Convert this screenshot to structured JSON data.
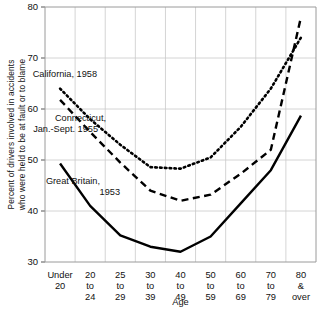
{
  "chart_data": {
    "type": "line",
    "title": "",
    "xlabel": "Age",
    "ylabel": "Percent of drivers involved in accidents who were held to be at fault or to blame",
    "ylabel_line1": "Percent of drivers involved in accidents",
    "ylabel_line2": "who were held to be at fault or to blame",
    "categories": [
      "Under 20",
      "20 to 24",
      "25 to 29",
      "30 to 39",
      "40 to 49",
      "50 to 59",
      "60 to 69",
      "70 to 79",
      "80 & over"
    ],
    "category_lines": [
      [
        "Under",
        "20"
      ],
      [
        "20",
        "to",
        "24"
      ],
      [
        "25",
        "to",
        "29"
      ],
      [
        "30",
        "to",
        "39"
      ],
      [
        "40",
        "to",
        "49"
      ],
      [
        "50",
        "to",
        "59"
      ],
      [
        "60",
        "to",
        "69"
      ],
      [
        "70",
        "to",
        "79"
      ],
      [
        "80",
        "&",
        "over"
      ]
    ],
    "ylim": [
      30,
      80
    ],
    "yticks": [
      30,
      40,
      50,
      60,
      70,
      80
    ],
    "ytick_labels": [
      "30",
      "40",
      "50",
      "60",
      "70",
      "80"
    ],
    "grid": true,
    "legend": "inline-annotations",
    "series": [
      {
        "name": "California, 1958",
        "style": "dotted",
        "color": "#000000",
        "label_lines": [
          "California, 1958"
        ],
        "values": [
          64.0,
          58.0,
          53.0,
          48.6,
          48.3,
          50.5,
          56.5,
          64.0,
          74.0
        ]
      },
      {
        "name": "Connecticut, Jan.-Sept. 1955",
        "style": "dashed",
        "color": "#000000",
        "label_lines": [
          "Connecticut,",
          "Jan.-Sept. 1955"
        ],
        "values": [
          61.8,
          55.5,
          49.5,
          44.0,
          42.0,
          43.2,
          47.3,
          52.0,
          78.0
        ]
      },
      {
        "name": "Great Britain, 1953",
        "style": "solid",
        "color": "#000000",
        "label_lines": [
          "Great Britain,",
          "1953"
        ],
        "values": [
          49.3,
          41.0,
          35.2,
          33.0,
          32.0,
          35.0,
          41.5,
          48.0,
          58.7
        ]
      }
    ]
  },
  "annotations": [
    {
      "text": "California, 1958",
      "x": 97,
      "y": 77
    },
    {
      "text": "Connecticut,",
      "x": 106,
      "y": 121
    },
    {
      "text": "Jan.-Sept. 1955",
      "x": 98,
      "y": 132
    },
    {
      "text": "Great Britain,",
      "x": 100,
      "y": 184
    },
    {
      "text": "1953",
      "x": 120,
      "y": 195
    }
  ]
}
